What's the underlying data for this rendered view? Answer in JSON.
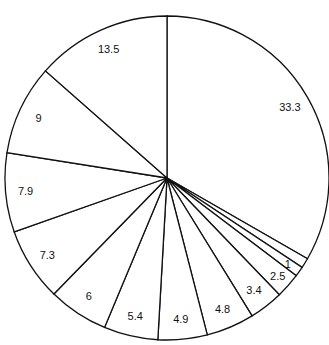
{
  "chart_data": {
    "type": "pie",
    "title": "",
    "start_angle_deg": 90,
    "direction": "clockwise",
    "slices": [
      {
        "label": "33.3",
        "value": 33.3,
        "show_label": true
      },
      {
        "label": "",
        "value": 1.0,
        "show_label": false
      },
      {
        "label": "1",
        "value": 1.0,
        "show_label": true
      },
      {
        "label": "2.5",
        "value": 2.5,
        "show_label": true
      },
      {
        "label": "3.4",
        "value": 3.4,
        "show_label": true
      },
      {
        "label": "4.8",
        "value": 4.8,
        "show_label": true
      },
      {
        "label": "4.9",
        "value": 4.9,
        "show_label": true
      },
      {
        "label": "5.4",
        "value": 5.4,
        "show_label": true
      },
      {
        "label": "6",
        "value": 6.0,
        "show_label": true
      },
      {
        "label": "7.3",
        "value": 7.3,
        "show_label": true
      },
      {
        "label": "7.9",
        "value": 7.9,
        "show_label": true
      },
      {
        "label": "9",
        "value": 9.0,
        "show_label": true
      },
      {
        "label": "13.5",
        "value": 13.5,
        "show_label": true
      }
    ],
    "colors": {
      "fill": "#ffffff",
      "stroke": "#111111"
    },
    "legend": "none"
  }
}
